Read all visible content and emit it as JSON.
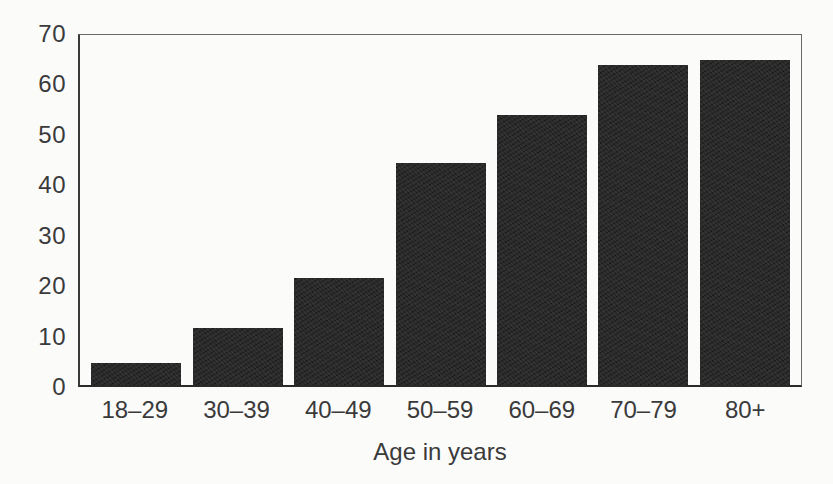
{
  "chart_data": {
    "type": "bar",
    "title": "",
    "xlabel": "Age in years",
    "ylabel": "",
    "categories": [
      "18–29",
      "30–39",
      "40–49",
      "50–59",
      "60–69",
      "70–79",
      "80+"
    ],
    "values": [
      4.5,
      11.5,
      21.5,
      44.5,
      54,
      64,
      65
    ],
    "ylim": [
      0,
      70
    ],
    "yticks": [
      0,
      10,
      20,
      30,
      40,
      50,
      60,
      70
    ],
    "grid": false,
    "legend": null,
    "bar_color": "#2b2b2b",
    "background_color": "#fbfbfa",
    "axis_color": "#3a3a3a",
    "text_color": "#3a3a3a"
  }
}
